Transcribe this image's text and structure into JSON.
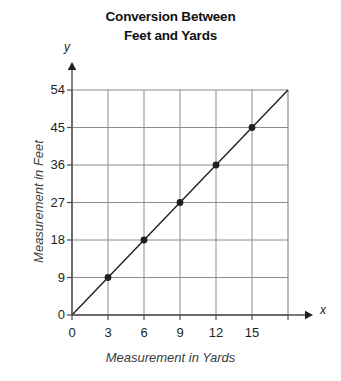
{
  "chart_data": {
    "type": "line",
    "title": "Conversion Between Feet and Yards",
    "title_lines": [
      "Conversion Between",
      "Feet and Yards"
    ],
    "xlabel": "Measurement in Yards",
    "ylabel": "Measurement in Feet",
    "x_axis_letter": "x",
    "y_axis_letter": "y",
    "xlim": [
      0,
      18
    ],
    "ylim": [
      0,
      54
    ],
    "x_ticks": [
      0,
      3,
      6,
      9,
      12,
      15,
      18
    ],
    "x_tick_labels": [
      "0",
      "3",
      "6",
      "9",
      "12",
      "15",
      ""
    ],
    "y_ticks": [
      0,
      9,
      18,
      27,
      36,
      45,
      54
    ],
    "y_tick_labels": [
      "0",
      "9",
      "18",
      "27",
      "36",
      "45",
      "54"
    ],
    "grid": true,
    "legend": "none",
    "line_color": "#231f20",
    "grid_color": "#8c8c8c",
    "axis_color": "#4d4d4d",
    "marker_color": "#231f20",
    "series": [
      {
        "name": "Feet per Yard",
        "relation": "y = 3x",
        "line_from": [
          0,
          0
        ],
        "line_to": [
          18,
          54
        ],
        "x": [
          3,
          6,
          9,
          12,
          15
        ],
        "values": [
          9,
          18,
          27,
          36,
          45
        ],
        "points": [
          {
            "x": 3,
            "y": 9
          },
          {
            "x": 6,
            "y": 18
          },
          {
            "x": 9,
            "y": 27
          },
          {
            "x": 12,
            "y": 36
          },
          {
            "x": 15,
            "y": 45
          }
        ]
      }
    ]
  }
}
